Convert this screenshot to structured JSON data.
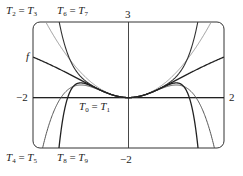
{
  "chart_data": {
    "type": "line",
    "title": "",
    "function": "f(x) = ln(1 + x^2)",
    "xlim": [
      -2,
      2
    ],
    "ylim": [
      -2,
      3
    ],
    "xlabel": "",
    "ylabel": "",
    "tick_labels": {
      "x_left": "−2",
      "x_right": "2",
      "y_top": "3",
      "y_bottom": "−2"
    },
    "grid": false,
    "series": [
      {
        "name": "f",
        "color": "#222222",
        "width": 1.3,
        "coeffs": null
      },
      {
        "name": "T0 = T1",
        "color": "#222222",
        "width": 1.3,
        "coeffs": [
          0
        ]
      },
      {
        "name": "T2 = T3",
        "color": "#999999",
        "width": 1.0,
        "coeffs": [
          0,
          0,
          1
        ]
      },
      {
        "name": "T4 = T5",
        "color": "#555555",
        "width": 1.0,
        "coeffs": [
          0,
          0,
          1,
          0,
          -0.5
        ]
      },
      {
        "name": "T6 = T7",
        "color": "#333333",
        "width": 1.1,
        "coeffs": [
          0,
          0,
          1,
          0,
          -0.5,
          0,
          0.3333333
        ]
      },
      {
        "name": "T8 = T9",
        "color": "#222222",
        "width": 1.3,
        "coeffs": [
          0,
          0,
          1,
          0,
          -0.5,
          0,
          0.3333333,
          0,
          -0.25
        ]
      }
    ],
    "annotations": [
      {
        "text": "T2 = T3",
        "position": "top-left"
      },
      {
        "text": "T6 = T7",
        "position": "top-left"
      },
      {
        "text": "f",
        "position": "left"
      },
      {
        "text": "T0 = T1",
        "position": "below x-axis left of origin"
      },
      {
        "text": "T4 = T5",
        "position": "bottom-left"
      },
      {
        "text": "T8 = T9",
        "position": "bottom-left"
      }
    ]
  },
  "labels": {
    "t2": {
      "T": "T",
      "a": "2",
      "eq": " = ",
      "b": "3"
    },
    "t6": {
      "T": "T",
      "a": "6",
      "eq": " = ",
      "b": "7"
    },
    "t4": {
      "T": "T",
      "a": "4",
      "eq": " = ",
      "b": "5"
    },
    "t8": {
      "T": "T",
      "a": "8",
      "eq": " = ",
      "b": "9"
    },
    "t0": {
      "T": "T",
      "a": "0",
      "eq": " = ",
      "b": "1"
    },
    "f": "f",
    "y_top": "3",
    "y_bottom": "−2",
    "x_left": "−2",
    "x_right": "2"
  }
}
